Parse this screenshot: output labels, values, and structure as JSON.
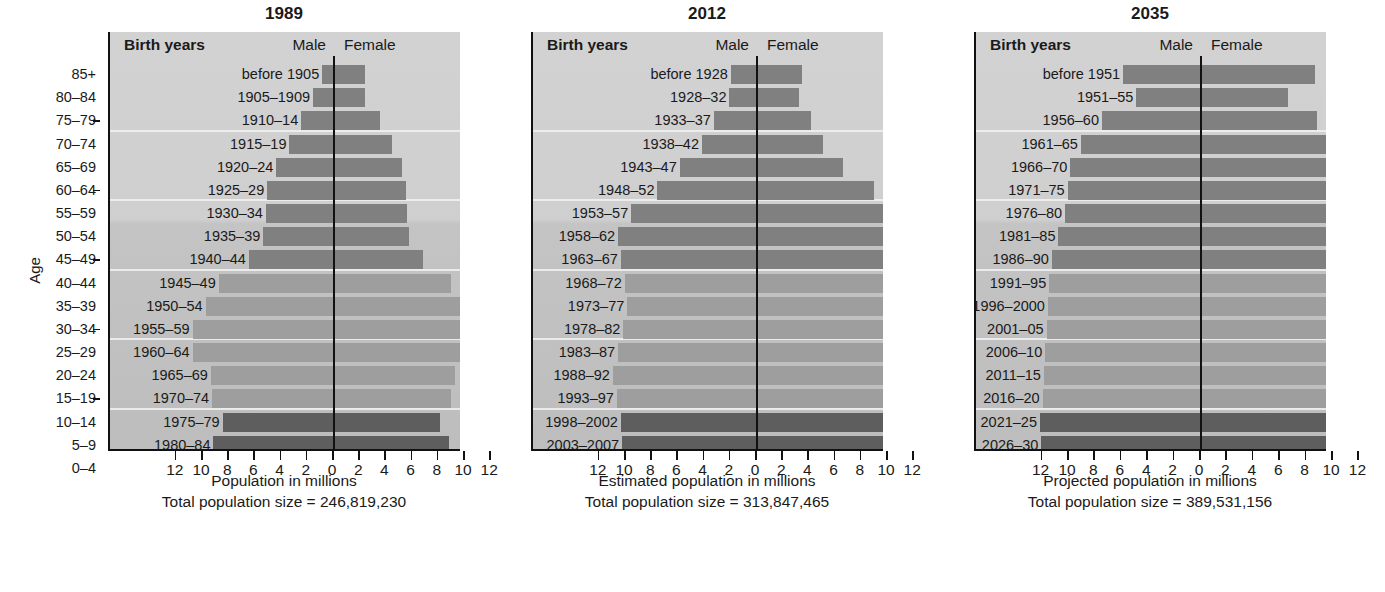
{
  "figure": {
    "age_axis_label": "Age",
    "age_ticks": [
      "85+",
      "80–84",
      "75–79",
      "70–74",
      "65–69",
      "60–64",
      "55–59",
      "50–54",
      "45–49",
      "40–44",
      "35–39",
      "30–34",
      "25–29",
      "20–24",
      "15–19",
      "10–14",
      "5–9",
      "0–4"
    ],
    "colors": {
      "bar_old": "#808080",
      "bar_mid": "#9e9e9e",
      "bar_young": "#5e5e5e",
      "plot_background": "#cfcfcf",
      "axis": "#111111",
      "gridline": "#f2f2f2"
    },
    "header": {
      "birth_years": "Birth years",
      "male": "Male",
      "female": "Female"
    }
  },
  "chart_data": {
    "type": "bar",
    "chart_kind": "population-pyramid",
    "shared": {
      "ylabel": "Age",
      "age_groups": [
        "85+",
        "80–84",
        "75–79",
        "70–74",
        "65–69",
        "60–64",
        "55–59",
        "50–54",
        "45–49",
        "40–44",
        "35–39",
        "30–34",
        "25–29",
        "20–24",
        "15–19",
        "10–14",
        "5–9",
        "0–4"
      ],
      "xlim": [
        -12,
        12
      ],
      "xticks": [
        12,
        10,
        8,
        6,
        4,
        2,
        0,
        2,
        4,
        6,
        8,
        10,
        12
      ],
      "xtick_labels": [
        "12",
        "10",
        "8",
        "6",
        "4",
        "2",
        "0",
        "2",
        "4",
        "6",
        "8",
        "10",
        "12"
      ],
      "grid": true,
      "legend": [
        "Male",
        "Female"
      ],
      "legend_position": "top-center",
      "units": "millions"
    },
    "panels": [
      {
        "title": "1989",
        "xlabel": "Population in millions",
        "total_label": "Total population size = 246,819,230",
        "total_population": 246819230,
        "rows": [
          {
            "age": "85+",
            "birth_years": "before 1905",
            "male": 0.9,
            "female": 2.4,
            "shade": "old"
          },
          {
            "age": "80–84",
            "birth_years": "1905–1909",
            "male": 1.6,
            "female": 2.4,
            "shade": "old"
          },
          {
            "age": "75–79",
            "birth_years": "1910–14",
            "male": 2.5,
            "female": 3.5,
            "shade": "old"
          },
          {
            "age": "70–74",
            "birth_years": "1915–19",
            "male": 3.4,
            "female": 4.4,
            "shade": "old"
          },
          {
            "age": "65–69",
            "birth_years": "1920–24",
            "male": 4.4,
            "female": 5.2,
            "shade": "old"
          },
          {
            "age": "60–64",
            "birth_years": "1925–29",
            "male": 5.1,
            "female": 5.5,
            "shade": "old"
          },
          {
            "age": "55–59",
            "birth_years": "1930–34",
            "male": 5.2,
            "female": 5.6,
            "shade": "old"
          },
          {
            "age": "50–54",
            "birth_years": "1935–39",
            "male": 5.4,
            "female": 5.7,
            "shade": "old"
          },
          {
            "age": "45–49",
            "birth_years": "1940–44",
            "male": 6.5,
            "female": 6.8,
            "shade": "old"
          },
          {
            "age": "40–44",
            "birth_years": "1945–49",
            "male": 8.8,
            "female": 8.9,
            "shade": "mid"
          },
          {
            "age": "35–39",
            "birth_years": "1950–54",
            "male": 9.8,
            "female": 9.9,
            "shade": "mid"
          },
          {
            "age": "30–34",
            "birth_years": "1955–59",
            "male": 10.8,
            "female": 10.9,
            "shade": "mid"
          },
          {
            "age": "25–29",
            "birth_years": "1960–64",
            "male": 10.8,
            "female": 10.9,
            "shade": "mid"
          },
          {
            "age": "20–24",
            "birth_years": "1965–69",
            "male": 9.4,
            "female": 9.2,
            "shade": "mid"
          },
          {
            "age": "15–19",
            "birth_years": "1970–74",
            "male": 9.3,
            "female": 8.9,
            "shade": "mid"
          },
          {
            "age": "10–14",
            "birth_years": "1975–79",
            "male": 8.5,
            "female": 8.1,
            "shade": "young"
          },
          {
            "age": "5–9",
            "birth_years": "1980–84",
            "male": 9.2,
            "female": 8.8,
            "shade": "young"
          },
          {
            "age": "0–4",
            "birth_years": "1985–89",
            "male": 9.4,
            "female": 9.0,
            "shade": "young"
          }
        ]
      },
      {
        "title": "2012",
        "xlabel": "Estimated population in millions",
        "total_label": "Total population size = 313,847,465",
        "total_population": 313847465,
        "rows": [
          {
            "age": "85+",
            "birth_years": "before 1928",
            "male": 2.0,
            "female": 3.4,
            "shade": "old"
          },
          {
            "age": "80–84",
            "birth_years": "1928–32",
            "male": 2.1,
            "female": 3.2,
            "shade": "old"
          },
          {
            "age": "75–79",
            "birth_years": "1933–37",
            "male": 3.3,
            "female": 4.1,
            "shade": "old"
          },
          {
            "age": "70–74",
            "birth_years": "1938–42",
            "male": 4.2,
            "female": 5.0,
            "shade": "old"
          },
          {
            "age": "65–69",
            "birth_years": "1943–47",
            "male": 5.9,
            "female": 6.6,
            "shade": "old"
          },
          {
            "age": "60–64",
            "birth_years": "1948–52",
            "male": 7.6,
            "female": 8.9,
            "shade": "old"
          },
          {
            "age": "55–59",
            "birth_years": "1953–57",
            "male": 9.6,
            "female": 10.4,
            "shade": "old"
          },
          {
            "age": "50–54",
            "birth_years": "1958–62",
            "male": 10.6,
            "female": 11.3,
            "shade": "old"
          },
          {
            "age": "45–49",
            "birth_years": "1963–67",
            "male": 10.4,
            "female": 10.8,
            "shade": "old"
          },
          {
            "age": "40–44",
            "birth_years": "1968–72",
            "male": 10.1,
            "female": 10.2,
            "shade": "mid"
          },
          {
            "age": "35–39",
            "birth_years": "1973–77",
            "male": 9.9,
            "female": 10.0,
            "shade": "mid"
          },
          {
            "age": "30–34",
            "birth_years": "1978–82",
            "male": 10.2,
            "female": 10.1,
            "shade": "mid"
          },
          {
            "age": "25–29",
            "birth_years": "1983–87",
            "male": 10.6,
            "female": 10.3,
            "shade": "mid"
          },
          {
            "age": "20–24",
            "birth_years": "1988–92",
            "male": 11.0,
            "female": 10.6,
            "shade": "mid"
          },
          {
            "age": "15–19",
            "birth_years": "1993–97",
            "male": 10.7,
            "female": 10.2,
            "shade": "mid"
          },
          {
            "age": "10–14",
            "birth_years": "1998–2002",
            "male": 10.4,
            "female": 10.0,
            "shade": "young"
          },
          {
            "age": "5–9",
            "birth_years": "2003–2007",
            "male": 10.3,
            "female": 9.9,
            "shade": "young"
          },
          {
            "age": "0–4",
            "birth_years": "2008–2012",
            "male": 10.4,
            "female": 10.0,
            "shade": "young"
          }
        ]
      },
      {
        "title": "2035",
        "xlabel": "Projected population in millions",
        "total_label": "Total population size = 389,531,156",
        "total_population": 389531156,
        "rows": [
          {
            "age": "85+",
            "birth_years": "before 1951",
            "male": 5.9,
            "female": 8.6,
            "shade": "old"
          },
          {
            "age": "80–84",
            "birth_years": "1951–55",
            "male": 4.9,
            "female": 6.6,
            "shade": "old"
          },
          {
            "age": "75–79",
            "birth_years": "1956–60",
            "male": 7.5,
            "female": 8.8,
            "shade": "old"
          },
          {
            "age": "70–74",
            "birth_years": "1961–65",
            "male": 9.1,
            "female": 10.0,
            "shade": "old"
          },
          {
            "age": "65–69",
            "birth_years": "1966–70",
            "male": 9.9,
            "female": 10.4,
            "shade": "old"
          },
          {
            "age": "60–64",
            "birth_years": "1971–75",
            "male": 10.1,
            "female": 10.5,
            "shade": "old"
          },
          {
            "age": "55–59",
            "birth_years": "1976–80",
            "male": 10.3,
            "female": 10.4,
            "shade": "old"
          },
          {
            "age": "50–54",
            "birth_years": "1981–85",
            "male": 10.8,
            "female": 10.8,
            "shade": "old"
          },
          {
            "age": "45–49",
            "birth_years": "1986–90",
            "male": 11.3,
            "female": 11.4,
            "shade": "old"
          },
          {
            "age": "40–44",
            "birth_years": "1991–95",
            "male": 11.5,
            "female": 11.4,
            "shade": "mid"
          },
          {
            "age": "35–39",
            "birth_years": "1996–2000",
            "male": 11.6,
            "female": 11.3,
            "shade": "mid"
          },
          {
            "age": "30–34",
            "birth_years": "2001–05",
            "male": 11.7,
            "female": 11.5,
            "shade": "mid"
          },
          {
            "age": "25–29",
            "birth_years": "2006–10",
            "male": 11.8,
            "female": 11.6,
            "shade": "mid"
          },
          {
            "age": "20–24",
            "birth_years": "2011–15",
            "male": 11.9,
            "female": 11.8,
            "shade": "mid"
          },
          {
            "age": "15–19",
            "birth_years": "2016–20",
            "male": 12.0,
            "female": 12.0,
            "shade": "mid"
          },
          {
            "age": "10–14",
            "birth_years": "2021–25",
            "male": 12.2,
            "female": 12.2,
            "shade": "young"
          },
          {
            "age": "5–9",
            "birth_years": "2026–30",
            "male": 12.1,
            "female": 12.1,
            "shade": "young"
          },
          {
            "age": "0–4",
            "birth_years": "2031–35",
            "male": 12.1,
            "female": 12.1,
            "shade": "young"
          }
        ]
      }
    ]
  }
}
